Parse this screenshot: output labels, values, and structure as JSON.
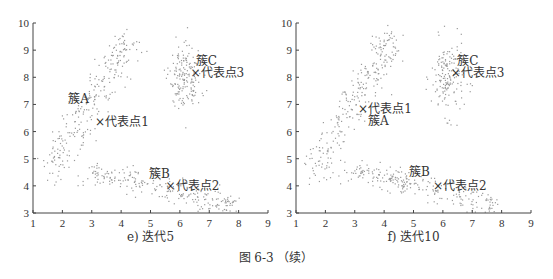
{
  "figure_caption": "图 6-3 （续）",
  "chart_data": [
    {
      "type": "scatter",
      "title": "",
      "subtitle": "e) 迭代5",
      "xlabel": "",
      "ylabel": "",
      "xlim": [
        1,
        9
      ],
      "ylim": [
        3,
        10
      ],
      "xticks": [
        1,
        2,
        3,
        4,
        5,
        6,
        7,
        8,
        9
      ],
      "yticks": [
        3,
        4,
        5,
        6,
        7,
        8,
        9,
        10
      ],
      "grid": false,
      "clusters": [
        {
          "name": "簇A",
          "label_pos": [
            2.55,
            7.2
          ],
          "representative": {
            "name": "代表点1",
            "x": 3.25,
            "y": 6.35
          }
        },
        {
          "name": "簇B",
          "label_pos": [
            5.3,
            4.45
          ],
          "representative": {
            "name": "代表点2",
            "x": 5.65,
            "y": 4.0
          }
        },
        {
          "name": "簇C",
          "label_pos": [
            6.9,
            8.6
          ],
          "representative": {
            "name": "代表点3",
            "x": 6.5,
            "y": 8.15
          }
        }
      ]
    },
    {
      "type": "scatter",
      "title": "",
      "subtitle": "f) 迭代10",
      "xlabel": "",
      "ylabel": "",
      "xlim": [
        1,
        9
      ],
      "ylim": [
        3,
        10
      ],
      "xticks": [
        1,
        2,
        3,
        4,
        5,
        6,
        7,
        8,
        9
      ],
      "yticks": [
        3,
        4,
        5,
        6,
        7,
        8,
        9,
        10
      ],
      "grid": false,
      "clusters": [
        {
          "name": "簇A",
          "label_pos": [
            3.8,
            6.4
          ],
          "representative": {
            "name": "代表点1",
            "x": 3.25,
            "y": 6.85
          }
        },
        {
          "name": "簇B",
          "label_pos": [
            5.2,
            4.5
          ],
          "representative": {
            "name": "代表点2",
            "x": 5.8,
            "y": 4.0
          }
        },
        {
          "name": "簇C",
          "label_pos": [
            6.85,
            8.6
          ],
          "representative": {
            "name": "代表点3",
            "x": 6.4,
            "y": 8.15
          }
        }
      ]
    }
  ],
  "marker_symbol": "×",
  "colors": {
    "axis": "#444444",
    "points": "#9a9a9a",
    "text": "#333333"
  }
}
